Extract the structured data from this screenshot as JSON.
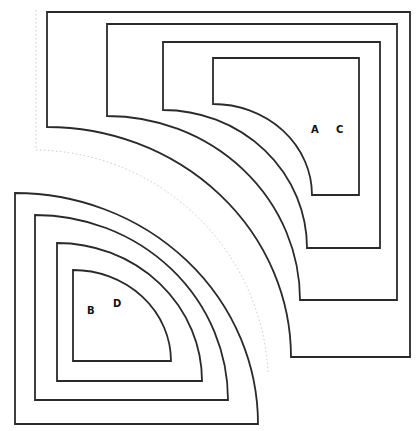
{
  "diagram": {
    "labels": {
      "a": "A",
      "c": "C",
      "b": "B",
      "d": "D"
    },
    "colors": {
      "stroke": "#2a2a2a",
      "background": "#ffffff",
      "faint": "#b8b8b8"
    }
  }
}
